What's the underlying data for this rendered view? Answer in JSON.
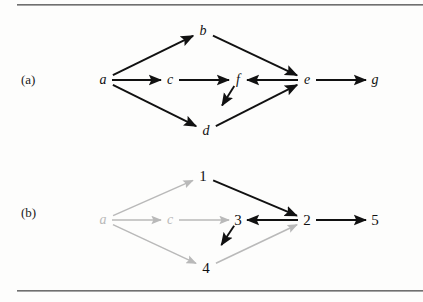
{
  "figure": {
    "type": "diagram",
    "rules": {
      "top": "horizontal-rule",
      "bottom": "horizontal-rule"
    },
    "colors": {
      "ink": "#111111",
      "dim": "#b9b9b9",
      "rule": "#5d5d5d",
      "background": "#fdfdfc"
    }
  },
  "panels": [
    {
      "id": "a",
      "label": "(a)",
      "nodes": [
        {
          "id": "a",
          "label": "a",
          "x": 103,
          "y": 80,
          "style": "italic",
          "tone": "ink"
        },
        {
          "id": "b",
          "label": "b",
          "x": 203,
          "y": 31,
          "style": "italic",
          "tone": "ink"
        },
        {
          "id": "c",
          "label": "c",
          "x": 170,
          "y": 80,
          "style": "italic",
          "tone": "ink"
        },
        {
          "id": "d",
          "label": "d",
          "x": 206,
          "y": 131,
          "style": "italic",
          "tone": "ink"
        },
        {
          "id": "e",
          "label": "e",
          "x": 307,
          "y": 80,
          "style": "italic",
          "tone": "ink"
        },
        {
          "id": "f",
          "label": "f",
          "x": 238,
          "y": 80,
          "style": "italic",
          "tone": "ink"
        },
        {
          "id": "g",
          "label": "g",
          "x": 375,
          "y": 80,
          "style": "italic",
          "tone": "ink"
        }
      ],
      "edges": [
        {
          "from": "a",
          "to": "b",
          "tone": "ink"
        },
        {
          "from": "a",
          "to": "c",
          "tone": "ink"
        },
        {
          "from": "a",
          "to": "d",
          "tone": "ink"
        },
        {
          "from": "b",
          "to": "e",
          "tone": "ink"
        },
        {
          "from": "c",
          "to": "f",
          "tone": "ink"
        },
        {
          "from": "f",
          "to": "d",
          "tone": "ink"
        },
        {
          "from": "d",
          "to": "e",
          "tone": "ink"
        },
        {
          "from": "e",
          "to": "f",
          "tone": "ink"
        },
        {
          "from": "e",
          "to": "g",
          "tone": "ink"
        }
      ]
    },
    {
      "id": "b",
      "label": "(b)",
      "nodes": [
        {
          "id": "a",
          "label": "a",
          "x": 103,
          "y": 220,
          "style": "italic",
          "tone": "dim"
        },
        {
          "id": "1",
          "label": "1",
          "x": 203,
          "y": 176,
          "style": "number",
          "tone": "ink"
        },
        {
          "id": "c",
          "label": "c",
          "x": 170,
          "y": 220,
          "style": "italic",
          "tone": "dim"
        },
        {
          "id": "4",
          "label": "4",
          "x": 206,
          "y": 268,
          "style": "number",
          "tone": "ink"
        },
        {
          "id": "2",
          "label": "2",
          "x": 307,
          "y": 220,
          "style": "number",
          "tone": "ink"
        },
        {
          "id": "3",
          "label": "3",
          "x": 238,
          "y": 220,
          "style": "number",
          "tone": "ink"
        },
        {
          "id": "5",
          "label": "5",
          "x": 375,
          "y": 220,
          "style": "number",
          "tone": "ink"
        }
      ],
      "edges": [
        {
          "from": "a",
          "to": "1",
          "tone": "dim"
        },
        {
          "from": "a",
          "to": "c",
          "tone": "dim"
        },
        {
          "from": "a",
          "to": "4",
          "tone": "dim"
        },
        {
          "from": "1",
          "to": "2",
          "tone": "ink"
        },
        {
          "from": "c",
          "to": "3",
          "tone": "dim"
        },
        {
          "from": "3",
          "to": "4",
          "tone": "ink"
        },
        {
          "from": "4",
          "to": "2",
          "tone": "dim"
        },
        {
          "from": "2",
          "to": "3",
          "tone": "ink"
        },
        {
          "from": "2",
          "to": "5",
          "tone": "ink"
        }
      ]
    }
  ]
}
